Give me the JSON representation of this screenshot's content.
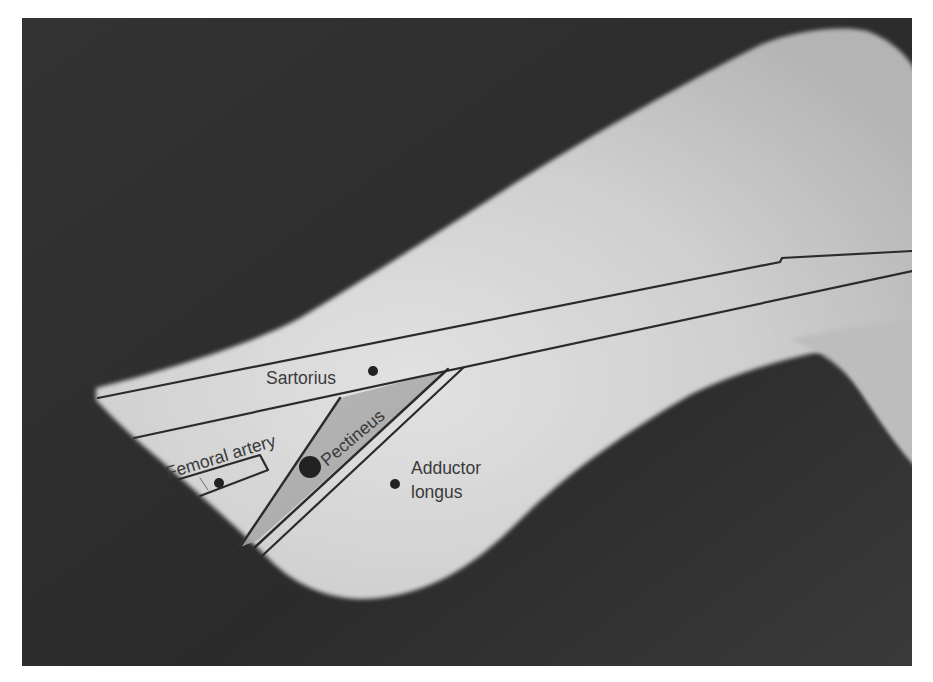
{
  "figure": {
    "colors": {
      "background_dark": "#2e2e2e",
      "skin_light": "#c9c9c9",
      "skin_highlight": "#dedede",
      "pectineus_band": "#a9a9a9",
      "outline": "#2b2b2b",
      "label_text": "#3a3a3a",
      "page_border": "#ffffff"
    },
    "labels": {
      "sartorius": "Sartorius",
      "femoral_artery": "Femoral artery",
      "pectineus": "Pectineus",
      "adductor_longus_line1": "Adductor",
      "adductor_longus_line2": "longus"
    },
    "markers": [
      {
        "name": "sartorius-marker",
        "x": 373,
        "y": 371,
        "r": 5
      },
      {
        "name": "femoral-artery-marker",
        "x": 219,
        "y": 483,
        "r": 5
      },
      {
        "name": "pectineus-marker",
        "x": 310,
        "y": 467,
        "r": 11
      },
      {
        "name": "adductor-longus-marker",
        "x": 395,
        "y": 484,
        "r": 5
      }
    ]
  }
}
